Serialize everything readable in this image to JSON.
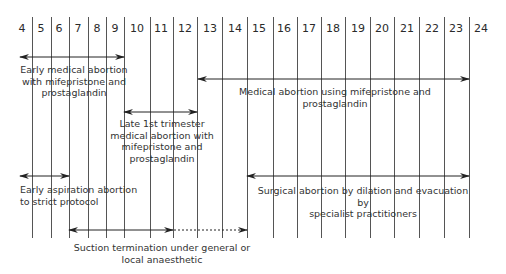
{
  "diagram": {
    "title_hidden": "",
    "axis": {
      "unit": "weeks of gestation",
      "labels": [
        "4",
        "5",
        "6",
        "7",
        "8",
        "9",
        "10",
        "11",
        "12",
        "13",
        "14",
        "15",
        "16",
        "17",
        "18",
        "19",
        "20",
        "21",
        "22",
        "23",
        "24"
      ]
    },
    "methods": [
      {
        "id": "early-medical",
        "lines": [
          "Early medical abortion",
          "with mifepristone and",
          "prostaglandin"
        ],
        "range_weeks": [
          "4",
          "9"
        ]
      },
      {
        "id": "medical-mife",
        "lines": [
          "Medical abortion using mifepristone and",
          "prostaglandin"
        ],
        "range_weeks": [
          "13",
          "24"
        ]
      },
      {
        "id": "late-first-trimester",
        "lines": [
          "Late 1st trimester",
          "medical abortion with",
          "mifepristone and",
          "prostaglandin"
        ],
        "range_weeks": [
          "9",
          "12"
        ]
      },
      {
        "id": "early-aspiration",
        "lines": [
          "Early aspiration abortion",
          "to strict protocol"
        ],
        "range_weeks": [
          "4",
          "7"
        ]
      },
      {
        "id": "surgical-de",
        "lines": [
          "Surgical abortion by dilation and evacuation by",
          "specialist practitioners"
        ],
        "range_weeks": [
          "15",
          "24"
        ]
      },
      {
        "id": "suction-termination",
        "lines": [
          "Suction termination under general or",
          "local anaesthetic"
        ],
        "range_weeks": [
          "7",
          "15"
        ],
        "solid_until_week": "11",
        "dotted_from_week": "11"
      }
    ]
  },
  "colors": {
    "line": "#555555",
    "arrow": "#222222",
    "text": "#333333"
  }
}
